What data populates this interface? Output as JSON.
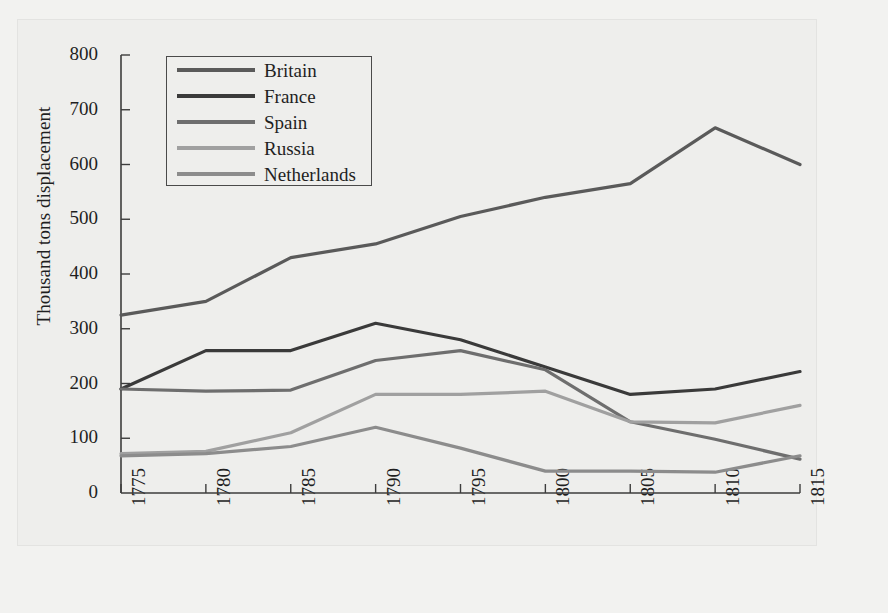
{
  "chart_data": {
    "type": "line",
    "title": "",
    "xlabel": "",
    "ylabel": "Thousand tons displacement",
    "x": [
      1775,
      1780,
      1785,
      1790,
      1795,
      1800,
      1805,
      1810,
      1815
    ],
    "xtick_labels": [
      "1775",
      "1780",
      "1785",
      "1790",
      "1795",
      "1800",
      "1805",
      "1810",
      "1815"
    ],
    "ytick_labels": [
      "0",
      "100",
      "200",
      "300",
      "400",
      "500",
      "600",
      "700",
      "800"
    ],
    "yticks": [
      0,
      100,
      200,
      300,
      400,
      500,
      600,
      700,
      800
    ],
    "ylim": [
      0,
      800
    ],
    "xlim": [
      1775,
      1815
    ],
    "grid": false,
    "legend_position": "upper-left-inside",
    "series": [
      {
        "name": "Britain",
        "color": "#5a5a5a",
        "values": [
          325,
          350,
          430,
          455,
          505,
          540,
          565,
          667,
          600
        ]
      },
      {
        "name": "France",
        "color": "#3a3a3a",
        "values": [
          190,
          260,
          260,
          310,
          280,
          230,
          180,
          190,
          222
        ]
      },
      {
        "name": "Spain",
        "color": "#6e6e6e",
        "values": [
          190,
          186,
          188,
          242,
          260,
          225,
          130,
          98,
          62
        ]
      },
      {
        "name": "Russia",
        "color": "#a0a0a0",
        "values": [
          72,
          76,
          110,
          180,
          180,
          186,
          130,
          128,
          160
        ]
      },
      {
        "name": "Netherlands",
        "color": "#8c8c8c",
        "values": [
          68,
          72,
          85,
          120,
          82,
          40,
          40,
          38,
          68
        ]
      }
    ]
  },
  "axis": {
    "y_title": "Thousand tons displacement"
  }
}
